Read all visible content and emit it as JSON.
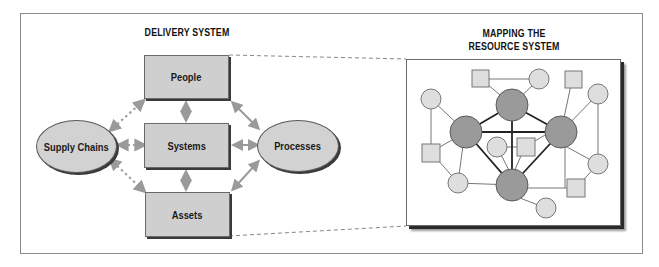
{
  "figure": {
    "delivery_system": {
      "title": "DELIVERY SYSTEM",
      "boxes": [
        {
          "id": "people",
          "label": "People"
        },
        {
          "id": "systems",
          "label": "Systems"
        },
        {
          "id": "assets",
          "label": "Assets"
        }
      ],
      "ellipses": [
        {
          "id": "supply_chains",
          "label": "Supply Chains"
        },
        {
          "id": "processes",
          "label": "Processes"
        }
      ],
      "connections": [
        {
          "from": "supply_chains",
          "to": "people",
          "style": "dotted",
          "arrow": "both"
        },
        {
          "from": "supply_chains",
          "to": "systems",
          "style": "dotted",
          "arrow": "both"
        },
        {
          "from": "supply_chains",
          "to": "assets",
          "style": "dotted",
          "arrow": "both"
        },
        {
          "from": "people",
          "to": "systems",
          "style": "solid",
          "arrow": "both"
        },
        {
          "from": "systems",
          "to": "assets",
          "style": "solid",
          "arrow": "both"
        },
        {
          "from": "people",
          "to": "processes",
          "style": "solid",
          "arrow": "both"
        },
        {
          "from": "systems",
          "to": "processes",
          "style": "solid",
          "arrow": "both"
        },
        {
          "from": "assets",
          "to": "processes",
          "style": "solid",
          "arrow": "both"
        }
      ]
    },
    "resource_system": {
      "title_line1": "MAPPING THE",
      "title_line2": "RESOURCE SYSTEM",
      "node_types": {
        "hub": "large dark circle",
        "circle": "small light circle",
        "square": "small light square"
      },
      "hub_count": 4,
      "peripheral_circle_count": 9,
      "peripheral_square_count": 5
    },
    "colors": {
      "box_fill": "#cfcfcf",
      "hub_fill": "#9a9a9a",
      "node_fill": "#dedede",
      "arrow": "#9a9a9a",
      "line": "#555555"
    }
  }
}
